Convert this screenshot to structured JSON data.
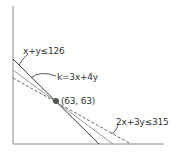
{
  "diagram": {
    "type": "linear-programming-graph",
    "labels": {
      "constraint1": "x+y≤126",
      "objective": "k=3x+4y",
      "point": "(63, 63)",
      "constraint2": "2x+3y≤315"
    },
    "optimal_point": {
      "x": 63,
      "y": 63
    },
    "lines": [
      {
        "name": "constraint1",
        "equation": "x+y≤126",
        "style": "solid",
        "color": "#3a3a3a"
      },
      {
        "name": "objective",
        "equation": "k=3x+4y",
        "style": "solid",
        "color": "#9a9a9a"
      },
      {
        "name": "constraint2",
        "equation": "2x+3y≤315",
        "style": "dashed",
        "color": "#555555"
      }
    ],
    "colors": {
      "axis": "#8c8c8c",
      "point": "#555555"
    }
  }
}
